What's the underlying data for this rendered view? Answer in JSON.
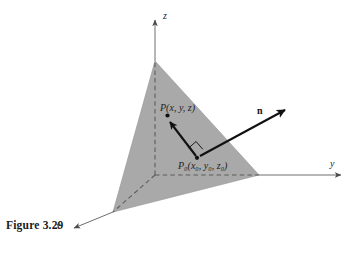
{
  "figure": {
    "caption": "Figure 3.29",
    "kind": "3d-plane-normal-vector-diagram"
  },
  "axes": {
    "z_label": "z",
    "y_label": "y",
    "x_label": "x",
    "origin": {
      "x": 155,
      "y": 175
    },
    "z_tip": {
      "x": 155,
      "y": 16
    },
    "y_tip": {
      "x": 345,
      "y": 175
    },
    "x_tip": {
      "x": 70,
      "y": 232
    },
    "style": "dashed-inside-plane-solid-outside"
  },
  "plane": {
    "label": "shaded-triangular-plane",
    "fill_color": "#a9a9a9",
    "stroke_color": "#8d8d8d",
    "vertices": [
      {
        "name": "apex-on-z-axis",
        "x": 155,
        "y": 61
      },
      {
        "name": "left-vertex-on-x-axis",
        "x": 113,
        "y": 212
      },
      {
        "name": "right-vertex-on-y-axis",
        "x": 259,
        "y": 175
      }
    ]
  },
  "points": {
    "P": {
      "label": "P(x, y, z)",
      "label_plain": "P(x, y, z)",
      "x": 168,
      "y": 116
    },
    "P0": {
      "label": "P0(x0, y0, z0)",
      "label_plain": "P₀(x₀, y₀, z₀)",
      "x": 197,
      "y": 158
    }
  },
  "vectors": {
    "normal": {
      "label": "n",
      "from": {
        "x": 197,
        "y": 158
      },
      "to": {
        "x": 288,
        "y": 108
      },
      "color": "#111111"
    },
    "in_plane": {
      "label": "",
      "from": {
        "x": 197,
        "y": 158
      },
      "to": {
        "x": 169,
        "y": 119
      },
      "color": "#111111"
    }
  },
  "markers": {
    "right_angle": {
      "label": "right-angle-marker",
      "at": {
        "x": 197,
        "y": 158
      }
    }
  },
  "colors": {
    "plane_fill": "#a9a9a9",
    "ink": "#111111",
    "axis": "#6f6f6f",
    "background": "#ffffff"
  }
}
